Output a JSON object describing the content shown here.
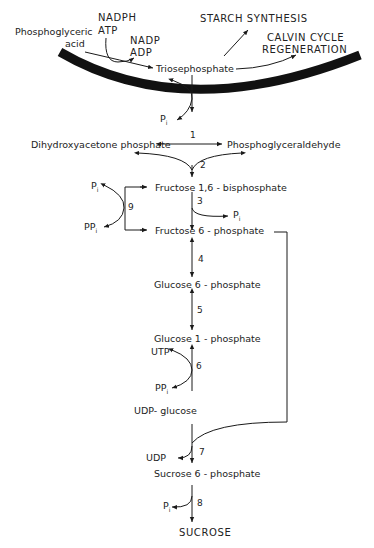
{
  "diagram": {
    "colors": {
      "line": "#1a1a1a",
      "membrane": "#111111",
      "background": "#ffffff"
    },
    "chloroplast_labels": {
      "phosphoglyceric": "Phosphoglyceric",
      "acid": "acid",
      "nadph": "NADPH",
      "atp": "ATP",
      "nadp": "NADP",
      "adp": "ADP",
      "triosephosphate": "Triosephosphate",
      "starch_synthesis": "STARCH  SYNTHESIS",
      "calvin_cycle": "CALVIN  CYCLE",
      "regeneration": "REGENERATION"
    },
    "nodes": {
      "pi_transport": "P",
      "dhap": "Dihydroxyacetone  phosphate",
      "pgald": "Phosphoglyceraldehyde",
      "f16bp": "Fructose  1,6 - bisphosphate",
      "f6p": "Fructose  6 - phosphate",
      "g6p": "Glucose   6 - phosphate",
      "g1p": "Glucose   1 - phosphate",
      "udpg": "UDP- glucose",
      "s6p": "Sucrose  6 - phosphate",
      "sucrose": "SUCROSE"
    },
    "side_products": {
      "pi_step3": "P",
      "pi_step9": "P",
      "ppi_step9": "PP",
      "utp_step6": "UTP",
      "ppi_step6": "PP",
      "udp_step7": "UDP",
      "pi_step8": "P",
      "subscript_i": "i"
    },
    "steps": [
      "1",
      "2",
      "3",
      "4",
      "5",
      "6",
      "7",
      "8",
      "9"
    ]
  }
}
